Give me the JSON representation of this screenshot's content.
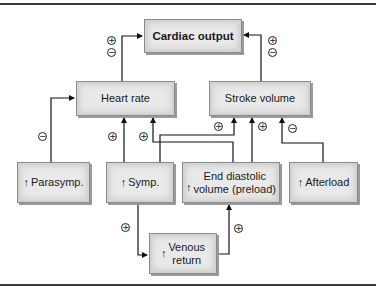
{
  "diagram": {
    "nodes": {
      "cardiac_output": {
        "label": "Cardiac output"
      },
      "heart_rate": {
        "label": "Heart rate"
      },
      "stroke_volume": {
        "label": "Stroke volume"
      },
      "parasymp": {
        "arrow": "↑",
        "label": "Parasymp."
      },
      "symp": {
        "arrow": "↑",
        "label": "Symp."
      },
      "edv": {
        "arrow": "↑",
        "label_line1": "End diastolic",
        "label_line2": "volume (preload)"
      },
      "afterload": {
        "arrow": "↑",
        "label": "Afterload"
      },
      "venous_return": {
        "arrow": "↑",
        "label_line1": "Venous",
        "label_line2": "return"
      }
    },
    "edges": [
      {
        "from": "heart_rate",
        "to": "cardiac_output",
        "signs": [
          "+",
          "−"
        ]
      },
      {
        "from": "stroke_volume",
        "to": "cardiac_output",
        "signs": [
          "+",
          "−"
        ]
      },
      {
        "from": "parasymp",
        "to": "heart_rate",
        "signs": [
          "−"
        ]
      },
      {
        "from": "symp",
        "to": "heart_rate",
        "signs": [
          "+"
        ]
      },
      {
        "from": "edv",
        "to": "heart_rate",
        "signs": [
          "+"
        ]
      },
      {
        "from": "symp",
        "to": "stroke_volume",
        "signs": [
          "+"
        ]
      },
      {
        "from": "edv",
        "to": "stroke_volume",
        "signs": [
          "+"
        ]
      },
      {
        "from": "afterload",
        "to": "stroke_volume",
        "signs": [
          "−"
        ]
      },
      {
        "from": "symp",
        "to": "venous_return",
        "signs": [
          "+"
        ]
      },
      {
        "from": "venous_return",
        "to": "edv",
        "signs": [
          "+"
        ]
      }
    ],
    "sign_glyphs": {
      "plus": "+",
      "minus": "−"
    }
  }
}
